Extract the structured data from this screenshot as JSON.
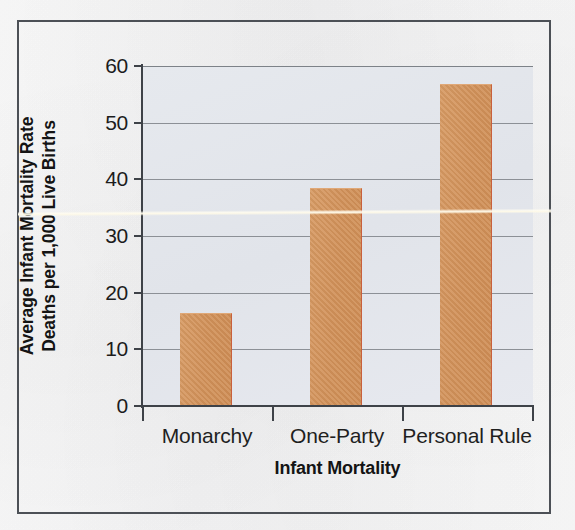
{
  "chart_data": {
    "type": "bar",
    "title": "",
    "subtitle": "",
    "xlabel": "Infant Mortality",
    "ylabel_line1": "Average Infant Mortality Rate",
    "ylabel_line2": "Deaths per 1,000 Live Births",
    "categories": [
      "Monarchy",
      "One-Party",
      "Personal Rule"
    ],
    "values": [
      16.5,
      38.5,
      56.8
    ],
    "series": [
      {
        "name": "Average Infant Mortality Rate",
        "values": [
          16.5,
          38.5,
          56.8
        ]
      }
    ],
    "ylim": [
      0,
      60
    ],
    "yticks": [
      60,
      50,
      40,
      30,
      20,
      10,
      0
    ],
    "ytick_labels": [
      "60",
      "50",
      "40",
      "30",
      "20",
      "10",
      "0"
    ],
    "grid": true,
    "grid_orientation": "horizontal",
    "legend": null,
    "legend_position": "none",
    "annotations": [],
    "bar_color": "#d1915a",
    "plot_background_color": "#e3e6ec",
    "gridline_color": "#8c9096",
    "axis_color": "#3e4248",
    "text_color": "#1c1c1c",
    "figure_background_color": "#f8f8f8",
    "frame_color": "#4c5056"
  },
  "figure": {
    "y_tick_labels": [
      "60",
      "50",
      "40",
      "30",
      "20",
      "10",
      "0"
    ],
    "category_labels": [
      "Monarchy",
      "One-Party",
      "Personal Rule"
    ],
    "x_axis_title": "Infant Mortality",
    "y_axis_title_line1": "Average Infant Mortality Rate",
    "y_axis_title_line2": "Deaths per 1,000 Live Births"
  }
}
